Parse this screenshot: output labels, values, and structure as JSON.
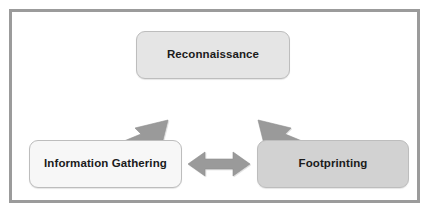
{
  "diagram": {
    "type": "cycle-relationship-diagram",
    "frame": {
      "border_color": "#9b9b9b",
      "background_color": "#ffffff"
    },
    "nodes": [
      {
        "id": "reconnaissance",
        "label": "Reconnaissance",
        "fill_color": "#e5e5e5",
        "border_color": "#bdbdbd",
        "text_color": "#1b1b1b"
      },
      {
        "id": "information-gathering",
        "label": "Information Gathering",
        "fill_color": "#f7f7f7",
        "border_color": "#bdbdbd",
        "text_color": "#1b1b1b"
      },
      {
        "id": "footprinting",
        "label": "Footprinting",
        "fill_color": "#d2d2d2",
        "border_color": "#bdbdbd",
        "text_color": "#1b1b1b"
      }
    ],
    "connectors": [
      {
        "id": "reconnaissance-information-gathering",
        "from": "information-gathering",
        "to": "reconnaissance",
        "style": "double-headed",
        "orientation": "diagonal-up-right",
        "color": "#9a9a9a"
      },
      {
        "id": "reconnaissance-footprinting",
        "from": "reconnaissance",
        "to": "footprinting",
        "style": "double-headed",
        "orientation": "diagonal-down-right",
        "color": "#9a9a9a"
      },
      {
        "id": "information-gathering-footprinting",
        "from": "information-gathering",
        "to": "footprinting",
        "style": "double-headed",
        "orientation": "horizontal",
        "color": "#9a9a9a"
      }
    ]
  }
}
